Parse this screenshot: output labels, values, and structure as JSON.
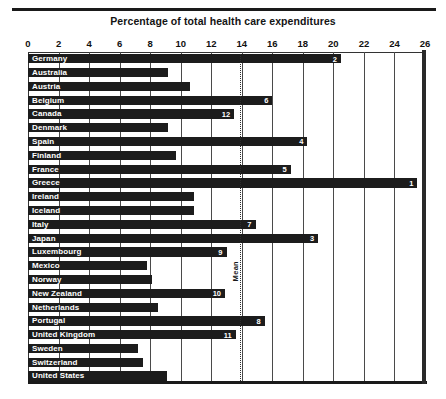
{
  "chart_data": {
    "type": "bar",
    "orientation": "horizontal",
    "title": "Percentage of total health care expenditures",
    "xlabel": "",
    "ylabel": "",
    "xlim": [
      0,
      26
    ],
    "xticks": [
      0,
      2,
      4,
      6,
      8,
      10,
      12,
      14,
      16,
      18,
      20,
      22,
      24,
      26
    ],
    "grid": true,
    "grid_axis": "x",
    "legend": false,
    "bar_color": "#1c1c1c",
    "categories": [
      "Germany",
      "Australia",
      "Austria",
      "Belgium",
      "Canada",
      "Denmark",
      "Spain",
      "Finland",
      "France",
      "Greece",
      "Ireland",
      "Iceland",
      "Italy",
      "Japan",
      "Luxembourg",
      "Mexico",
      "Norway",
      "New Zealand",
      "Netherlands",
      "Portugal",
      "United Kingdom",
      "Sweden",
      "Switzerland",
      "United States"
    ],
    "values": [
      20.5,
      9.2,
      10.6,
      16.0,
      13.5,
      9.2,
      18.3,
      9.7,
      17.2,
      25.5,
      10.9,
      10.9,
      14.9,
      19.0,
      13.0,
      7.8,
      8.1,
      12.9,
      8.5,
      15.5,
      13.6,
      7.2,
      7.5,
      9.1
    ],
    "point_labels": [
      "2",
      "",
      "",
      "6",
      "12",
      "",
      "4",
      "",
      "5",
      "1",
      "",
      "",
      "7",
      "3",
      "9",
      "",
      "",
      "10",
      "",
      "8",
      "11",
      "",
      "",
      ""
    ],
    "annotations": [
      {
        "name": "mean-line",
        "label": "Mean",
        "value": 13.9,
        "style": "dotted-vertical"
      }
    ]
  }
}
